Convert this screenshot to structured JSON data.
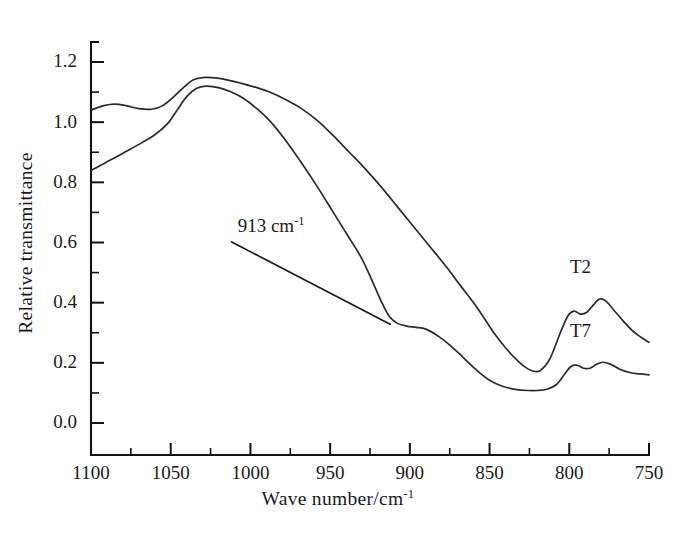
{
  "chart_data": {
    "type": "line",
    "title": "",
    "xlabel": "Wave number/cm",
    "xlabel_sup": "-1",
    "ylabel": "Relative transmittance",
    "xlim": [
      1100,
      750
    ],
    "ylim": [
      -0.09,
      1.32
    ],
    "x_axis_direction": "descending",
    "grid": false,
    "legend": "inline-curve-labels",
    "xticks": [
      1100,
      1050,
      1000,
      950,
      900,
      850,
      800,
      750
    ],
    "xtick_labels": [
      "1100",
      "1050",
      "1000",
      "950",
      "900",
      "850",
      "800",
      "750"
    ],
    "x_minor_tick_step": 25,
    "yticks": [
      0.0,
      0.2,
      0.4,
      0.6,
      0.8,
      1.0,
      1.2
    ],
    "ytick_labels": [
      "0.0",
      "0.2",
      "0.4",
      "0.6",
      "0.8",
      "1.0",
      "1.2"
    ],
    "y_minor_tick_step": 0.1,
    "annotations": [
      {
        "text": "913 cm",
        "sup": "-1",
        "value": 913,
        "unit": "cm^-1",
        "label_x": 1008,
        "label_y": 0.635,
        "target_x": 913,
        "target_y": 0.325
      }
    ],
    "series": [
      {
        "name": "T2",
        "label_x": 793,
        "label_y": 0.5,
        "x": [
          1100,
          1092,
          1085,
          1078,
          1070,
          1062,
          1055,
          1048,
          1042,
          1036,
          1030,
          1022,
          1014,
          1005,
          996,
          988,
          978,
          968,
          958,
          948,
          938,
          928,
          918,
          908,
          898,
          888,
          878,
          868,
          858,
          848,
          840,
          832,
          826,
          822,
          818,
          812,
          806,
          801,
          797,
          793,
          789,
          785,
          781,
          777,
          772,
          766,
          760,
          755,
          750
        ],
        "y": [
          1.04,
          1.055,
          1.06,
          1.055,
          1.045,
          1.043,
          1.055,
          1.085,
          1.115,
          1.14,
          1.148,
          1.147,
          1.14,
          1.128,
          1.115,
          1.1,
          1.075,
          1.045,
          1.005,
          0.955,
          0.9,
          0.845,
          0.785,
          0.72,
          0.655,
          0.59,
          0.525,
          0.455,
          0.385,
          0.305,
          0.25,
          0.205,
          0.18,
          0.172,
          0.175,
          0.215,
          0.295,
          0.355,
          0.372,
          0.362,
          0.368,
          0.392,
          0.412,
          0.405,
          0.375,
          0.338,
          0.305,
          0.285,
          0.268
        ]
      },
      {
        "name": "T7",
        "label_x": 793,
        "label_y": 0.285,
        "x": [
          1100,
          1092,
          1084,
          1076,
          1068,
          1060,
          1052,
          1046,
          1040,
          1034,
          1028,
          1020,
          1012,
          1004,
          996,
          988,
          978,
          968,
          958,
          948,
          938,
          930,
          923,
          918,
          913,
          908,
          902,
          896,
          890,
          882,
          874,
          866,
          858,
          850,
          842,
          834,
          826,
          820,
          814,
          808,
          803,
          799,
          795,
          791,
          787,
          783,
          779,
          774,
          768,
          762,
          756,
          750
        ],
        "y": [
          0.84,
          0.862,
          0.885,
          0.908,
          0.932,
          0.958,
          0.995,
          1.04,
          1.085,
          1.112,
          1.12,
          1.115,
          1.1,
          1.078,
          1.045,
          1.005,
          0.94,
          0.865,
          0.785,
          0.7,
          0.615,
          0.545,
          0.465,
          0.405,
          0.355,
          0.332,
          0.322,
          0.318,
          0.312,
          0.288,
          0.255,
          0.215,
          0.175,
          0.142,
          0.122,
          0.112,
          0.108,
          0.108,
          0.112,
          0.128,
          0.162,
          0.188,
          0.192,
          0.182,
          0.182,
          0.195,
          0.202,
          0.195,
          0.178,
          0.168,
          0.163,
          0.16
        ]
      }
    ],
    "colors": {
      "curve": "#2b2b2b",
      "axis": "#111111",
      "text": "#1a1a1a",
      "background": "#ffffff"
    }
  }
}
